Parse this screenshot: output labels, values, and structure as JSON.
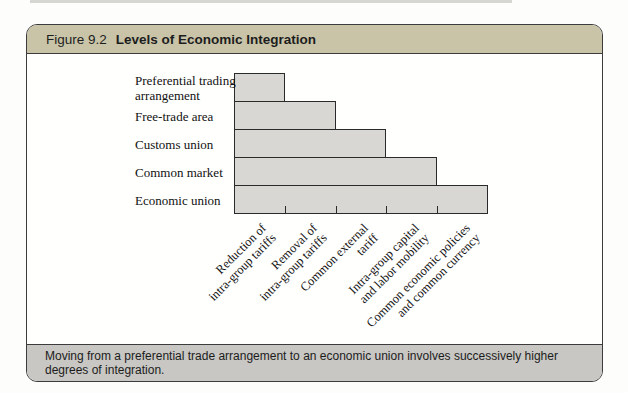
{
  "figure": {
    "label": "Figure 9.2",
    "title": "Levels of Economic Integration",
    "caption": "Moving from a preferential trade arrangement to an economic union involves successively higher degrees of integration.",
    "colors": {
      "header_bg": "#c9c4a8",
      "caption_bg": "#c8c7c3",
      "bar_fill": "#d8d7d4",
      "bar_border": "#2a2a2a",
      "box_border": "#3c3c3c",
      "text_dark": "#1d1d1d"
    }
  },
  "chart_data": {
    "type": "bar",
    "orientation": "horizontal",
    "title": "Levels of Economic Integration",
    "categories": [
      [
        "Preferential trading",
        "arrangement"
      ],
      [
        "Free-trade area"
      ],
      [
        "Customs union"
      ],
      [
        "Common market"
      ],
      [
        "Economic union"
      ]
    ],
    "values": [
      1,
      2,
      3,
      4,
      5
    ],
    "value_unit": "cumulative integration steps",
    "x_tick_labels": [
      [
        "Reduction of",
        "intra-group tariffs"
      ],
      [
        "Removal of",
        "intra-group tariffs"
      ],
      [
        "Common external",
        "tariff"
      ],
      [
        "Intra-group capital",
        "and labor mobility"
      ],
      [
        "Common economic policies",
        "and common currency"
      ]
    ],
    "xlim": [
      0,
      5
    ],
    "grid": false,
    "legend": false,
    "bar_color": "#d8d7d4"
  }
}
